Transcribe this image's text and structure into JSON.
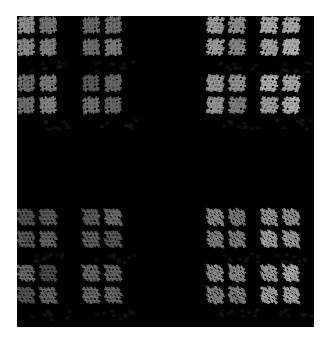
{
  "image": {
    "width": 329,
    "height": 344,
    "background": "#ffffff",
    "frame": {
      "x": 17,
      "y": 16,
      "width": 297,
      "height": 311,
      "color": "#000000"
    }
  },
  "fractal": {
    "description": "Self-similar grid of sheared hash-like glyph clusters in gray on black",
    "block_columns": [
      19,
      84,
      208,
      262
    ],
    "block_rows": [
      18,
      76,
      210,
      266
    ],
    "block_width": 46,
    "block_height": 46,
    "cluster_offsets": [
      0,
      22
    ],
    "glyph_size": 15,
    "quadrants": [
      {
        "name": "top-left",
        "cols": [
          0,
          1
        ],
        "rows": [
          0,
          1
        ],
        "shear": [
          0.15,
          -0.25
        ],
        "brightness": [
          130,
          115,
          120,
          105
        ]
      },
      {
        "name": "top-right",
        "cols": [
          2,
          3
        ],
        "rows": [
          0,
          1
        ],
        "shear": [
          -0.35,
          0.2
        ],
        "brightness": [
          150,
          175,
          140,
          160
        ]
      },
      {
        "name": "bottom-left",
        "cols": [
          0,
          1
        ],
        "rows": [
          2,
          3
        ],
        "shear": [
          0.45,
          0.1
        ],
        "brightness": [
          85,
          95,
          90,
          100
        ]
      },
      {
        "name": "bottom-right",
        "cols": [
          2,
          3
        ],
        "rows": [
          2,
          3
        ],
        "shear": [
          0.3,
          0.35
        ],
        "brightness": [
          135,
          150,
          140,
          165
        ]
      }
    ],
    "ghost_color": "#1e1e1e",
    "glyph_color_base": "#8a8a8a"
  }
}
